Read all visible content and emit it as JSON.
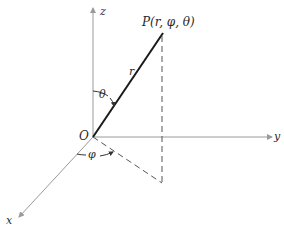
{
  "diagram": {
    "point_label": "P(r, φ, θ)",
    "origin_label": "O",
    "axes": {
      "x": "x",
      "y": "y",
      "z": "z"
    },
    "radius_label": "r",
    "polar_angle_label": "θ",
    "azimuth_angle_label": "φ",
    "colors": {
      "axis": "#9a9a9a",
      "radius": "#1a1a1a",
      "dashed": "#555555",
      "text": "#2a2a2a"
    }
  }
}
